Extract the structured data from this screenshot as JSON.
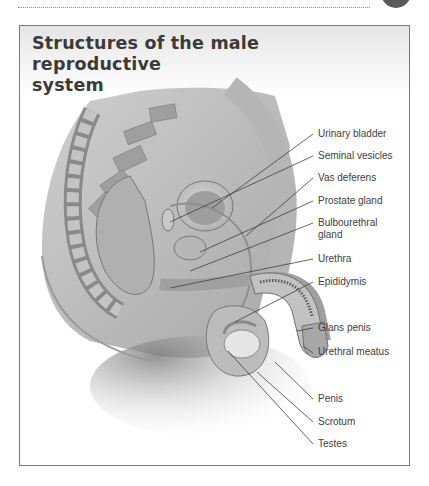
{
  "page": {
    "decorations": {
      "page_circle_color": "#5a5a5a",
      "rule_style": "dotted"
    }
  },
  "figure": {
    "title": "Structures of the male reproductive system",
    "title_line1": "Structures of the male reproductive",
    "title_line2": "system",
    "labels": [
      {
        "id": "urinary-bladder",
        "text": "Urinary bladder"
      },
      {
        "id": "seminal-vesicles",
        "text": "Seminal vesicles"
      },
      {
        "id": "vas-deferens",
        "text": "Vas deferens"
      },
      {
        "id": "prostate-gland",
        "text": "Prostate gland"
      },
      {
        "id": "bulbourethral-gland",
        "text": "Bulbourethral",
        "text2": "gland"
      },
      {
        "id": "urethra",
        "text": "Urethra"
      },
      {
        "id": "epididymis",
        "text": "Epididymis"
      },
      {
        "id": "glans-penis",
        "text": "Glans penis"
      },
      {
        "id": "urethral-meatus",
        "text": "Urethral meatus"
      },
      {
        "id": "penis",
        "text": "Penis"
      },
      {
        "id": "scrotum",
        "text": "Scrotum"
      },
      {
        "id": "testes",
        "text": "Testes"
      }
    ]
  }
}
